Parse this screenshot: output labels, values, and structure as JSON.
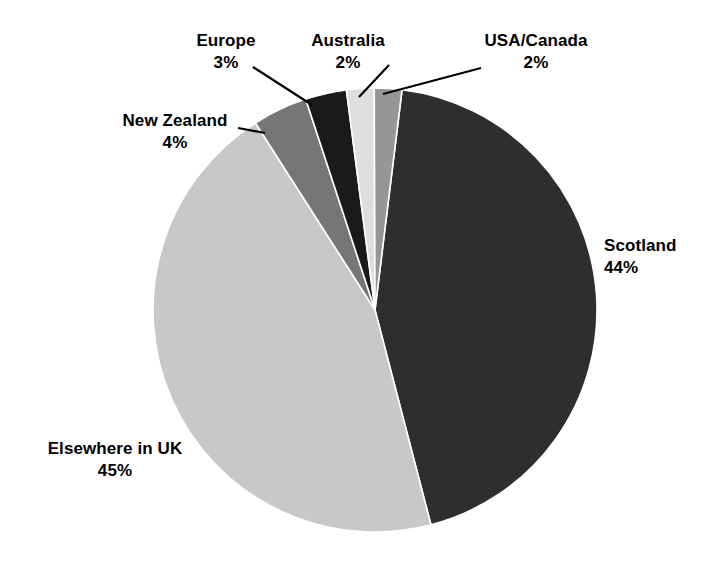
{
  "chart_data": {
    "type": "pie",
    "title": "",
    "subtitle": "",
    "xlabel": "",
    "ylabel": "",
    "legend_position": "none",
    "grid": false,
    "value_suffix": "%",
    "start_angle_deg": 7,
    "direction": "clockwise",
    "categories": [
      "Scotland",
      "Elsewhere in UK",
      "New Zealand",
      "Europe",
      "Australia",
      "USA/Canada"
    ],
    "values": [
      44,
      45,
      4,
      3,
      2,
      2
    ],
    "labels": [
      "44%",
      "45%",
      "4%",
      "3%",
      "2%",
      "2%"
    ],
    "colors": [
      "#2e2e2e",
      "#c8c8c8",
      "#767676",
      "#1a1a1a",
      "#dedede",
      "#969696"
    ],
    "slices": [
      {
        "name": "Scotland",
        "value": 44,
        "value_label": "44%",
        "color": "#2e2e2e"
      },
      {
        "name": "Elsewhere in UK",
        "value": 45,
        "value_label": "45%",
        "color": "#c8c8c8"
      },
      {
        "name": "New Zealand",
        "value": 4,
        "value_label": "4%",
        "color": "#767676"
      },
      {
        "name": "Europe",
        "value": 3,
        "value_label": "3%",
        "color": "#1a1a1a"
      },
      {
        "name": "Australia",
        "value": 2,
        "value_label": "2%",
        "color": "#dedede"
      },
      {
        "name": "USA/Canada",
        "value": 2,
        "value_label": "2%",
        "color": "#969696"
      }
    ]
  },
  "labels": {
    "scotland": {
      "name": "Scotland",
      "value": "44%"
    },
    "elsewhere_in_uk": {
      "name": "Elsewhere in UK",
      "value": "45%"
    },
    "new_zealand": {
      "name": "New Zealand",
      "value": "4%"
    },
    "europe": {
      "name": "Europe",
      "value": "3%"
    },
    "australia": {
      "name": "Australia",
      "value": "2%"
    },
    "usa_canada": {
      "name": "USA/Canada",
      "value": "2%"
    }
  },
  "style": {
    "background": "#ffffff",
    "text_color": "#000000",
    "leader_line_color": "#000000"
  }
}
